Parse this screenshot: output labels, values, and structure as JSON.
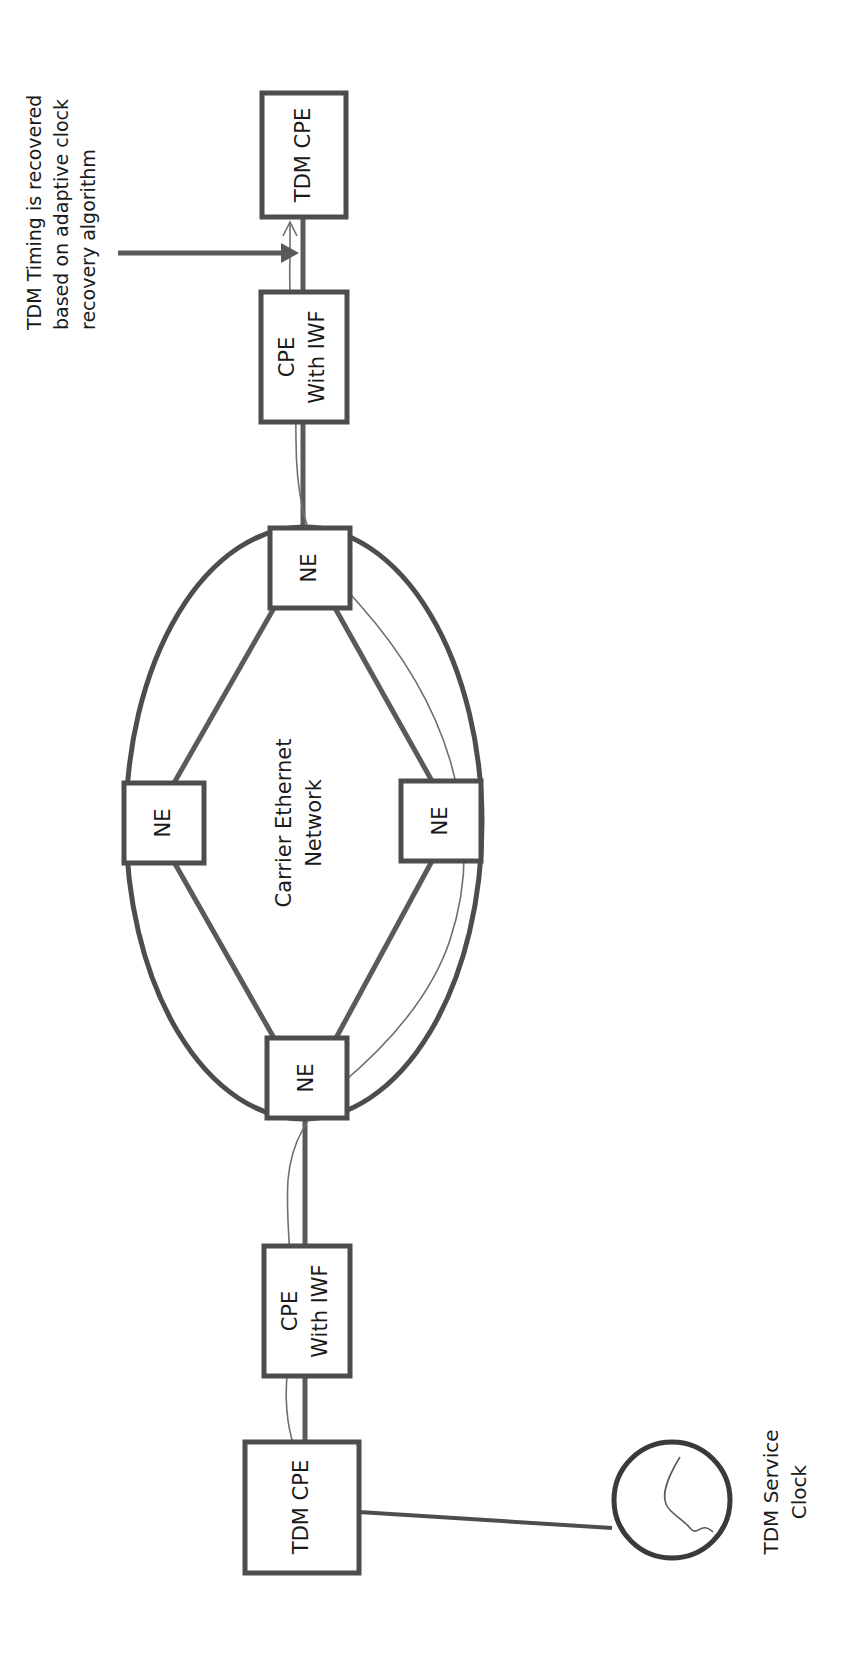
{
  "page": {
    "orientation": "rotated-90-ccw",
    "background_color": "#ffffff",
    "line_color": "#4d4d4d",
    "text_color": "#1a1a1a",
    "width": 856,
    "height": 1659
  },
  "annotation": {
    "name": "adaptive-clock-recovery-note",
    "lines": [
      "TDM Timing is recovered",
      "based on adaptive clock",
      "recovery algorithm"
    ],
    "full_text": "TDM Timing is recovered based on adaptive clock recovery algorithm",
    "points_to": "TDM CPE (right side)"
  },
  "nodes": [
    {
      "id": "tdm-cpe-right",
      "label_lines": [
        "TDM CPE"
      ],
      "shape": "rectangle",
      "role": "customer-premises-equipment"
    },
    {
      "id": "cpe-iwf-right",
      "label_lines": [
        "CPE",
        "With IWF"
      ],
      "shape": "rectangle",
      "role": "interworking-function"
    },
    {
      "id": "ne-top",
      "label_lines": [
        "NE"
      ],
      "shape": "rectangle",
      "role": "network-element"
    },
    {
      "id": "ne-left",
      "label_lines": [
        "NE"
      ],
      "shape": "rectangle",
      "role": "network-element"
    },
    {
      "id": "ne-right",
      "label_lines": [
        "NE"
      ],
      "shape": "rectangle",
      "role": "network-element"
    },
    {
      "id": "ne-bottom",
      "label_lines": [
        "NE"
      ],
      "shape": "rectangle",
      "role": "network-element"
    },
    {
      "id": "cpe-iwf-left",
      "label_lines": [
        "CPE",
        "With IWF"
      ],
      "shape": "rectangle",
      "role": "interworking-function"
    },
    {
      "id": "tdm-cpe-left",
      "label_lines": [
        "TDM CPE"
      ],
      "shape": "rectangle",
      "role": "customer-premises-equipment"
    },
    {
      "id": "tdm-service-clock",
      "label_lines": [
        "TDM Service",
        "Clock"
      ],
      "shape": "circle-with-sine",
      "role": "reference-clock"
    }
  ],
  "cloud": {
    "id": "carrier-ethernet-network",
    "shape": "ellipse",
    "label_lines": [
      "Carrier  Ethernet",
      "Network"
    ]
  },
  "links": [
    {
      "from": "tdm-cpe-right",
      "to": "cpe-iwf-right",
      "style": "thick"
    },
    {
      "from": "cpe-iwf-right",
      "to": "ne-top",
      "style": "thick"
    },
    {
      "from": "ne-top",
      "to": "ne-left",
      "style": "thick"
    },
    {
      "from": "ne-top",
      "to": "ne-right",
      "style": "thick"
    },
    {
      "from": "ne-left",
      "to": "ne-bottom",
      "style": "thick"
    },
    {
      "from": "ne-right",
      "to": "ne-bottom",
      "style": "thick"
    },
    {
      "from": "ne-bottom",
      "to": "cpe-iwf-left",
      "style": "thick"
    },
    {
      "from": "cpe-iwf-left",
      "to": "tdm-cpe-left",
      "style": "thick"
    },
    {
      "from": "tdm-cpe-left",
      "to": "tdm-service-clock",
      "style": "thin"
    }
  ],
  "timing_flow": {
    "name": "tdm-timing-path",
    "description": "Thin curved line tracing timing from TDM Service Clock through the network to the far-end TDM CPE",
    "style": "thin-curve-with-arrowhead"
  }
}
